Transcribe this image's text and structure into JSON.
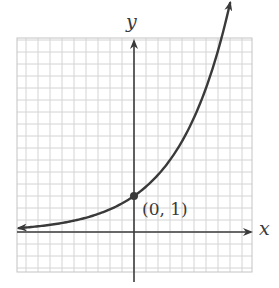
{
  "chart_data": {
    "type": "line",
    "title": "",
    "function": "y = 2^x",
    "xlabel": "x",
    "ylabel": "y",
    "grid": true,
    "grid_minor_step": 0.3333,
    "xlim": [
      -3.25,
      3.25
    ],
    "ylim": [
      -1.1,
      5.4
    ],
    "series": [
      {
        "name": "exponential curve",
        "x": [
          -3.2,
          -3,
          -2,
          -1,
          0,
          1,
          2,
          2.67
        ],
        "y": [
          0.11,
          0.125,
          0.25,
          0.5,
          1,
          2,
          4,
          6.35
        ],
        "arrows": "both"
      }
    ],
    "annotations": [
      {
        "text": "(0, 1)",
        "x": 0,
        "y": 1,
        "marker": "filled-dot"
      }
    ],
    "legend": null
  },
  "labels": {
    "x_axis": "x",
    "y_axis": "y",
    "point": "(0, 1)"
  },
  "colors": {
    "grid": "#d4d4d4",
    "grid_major": "#c4c4c4",
    "axis": "#3c3c3c",
    "curve": "#3a3a3a",
    "background": "#ffffff"
  }
}
